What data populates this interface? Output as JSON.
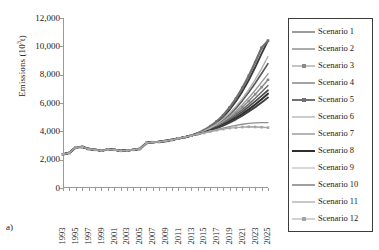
{
  "panel": {
    "letter": "a)"
  },
  "axes": {
    "ylabel_text": "Emissions (10",
    "ylabel_sup": "3",
    "ylabel_tail": "t)",
    "ylabel_full": "Emissions (10³t)",
    "yticks": [
      "12,000",
      "10,000",
      "8,000",
      "6,000",
      "4,000",
      "2,000",
      "0"
    ],
    "xticks": [
      "1993",
      "1995",
      "1997",
      "1999",
      "2001",
      "2003",
      "2005",
      "2007",
      "2009",
      "2011",
      "2013",
      "2015",
      "2017",
      "2019",
      "2021",
      "2023",
      "2025"
    ]
  },
  "legend": {
    "items": [
      {
        "label": "Scenario 1",
        "color": "#3a3a3a",
        "width": 1.9,
        "marker": "none"
      },
      {
        "label": "Scenario 2",
        "color": "#5a5a5a",
        "width": 1.7,
        "marker": "none"
      },
      {
        "label": "Scenario 3",
        "color": "#8a8a8a",
        "width": 1.5,
        "marker": "square"
      },
      {
        "label": "Scenario 4",
        "color": "#4a4a4a",
        "width": 1.7,
        "marker": "none"
      },
      {
        "label": "Scenario 5",
        "color": "#707070",
        "width": 2.2,
        "marker": "square"
      },
      {
        "label": "Scenario 6",
        "color": "#9a9a9a",
        "width": 1.4,
        "marker": "none"
      },
      {
        "label": "Scenario 7",
        "color": "#6a6a6a",
        "width": 1.5,
        "marker": "none"
      },
      {
        "label": "Scenario 8",
        "color": "#2e2e2e",
        "width": 2.0,
        "marker": "none"
      },
      {
        "label": "Scenario 9",
        "color": "#b0b0b0",
        "width": 1.4,
        "marker": "none"
      },
      {
        "label": "Scenario 10",
        "color": "#3f3f3f",
        "width": 1.9,
        "marker": "none"
      },
      {
        "label": "Scenario 11",
        "color": "#8f8f8f",
        "width": 1.3,
        "marker": "none"
      },
      {
        "label": "Scenario 12",
        "color": "#a5a5a5",
        "width": 1.4,
        "marker": "square"
      }
    ]
  },
  "chart_data": {
    "type": "line",
    "title": "",
    "xlabel": "",
    "ylabel": "Emissions (10³t)",
    "xlim": [
      1993,
      2025
    ],
    "ylim": [
      0,
      12000
    ],
    "ytick_step": 2000,
    "grid": false,
    "legend_position": "right",
    "x": [
      1993,
      1994,
      1995,
      1996,
      1997,
      1998,
      1999,
      2000,
      2001,
      2002,
      2003,
      2004,
      2005,
      2006,
      2007,
      2008,
      2009,
      2010,
      2011,
      2012,
      2013,
      2014,
      2015,
      2016,
      2017,
      2018,
      2019,
      2020,
      2021,
      2022,
      2023,
      2024,
      2025
    ],
    "historical_end_year": 2013,
    "historical": [
      2380,
      2480,
      2870,
      2900,
      2760,
      2700,
      2640,
      2720,
      2700,
      2630,
      2650,
      2700,
      2760,
      3180,
      3230,
      3260,
      3320,
      3400,
      3500,
      3580,
      3700,
      3790,
      3880,
      3990,
      4080,
      4160,
      4230,
      4260,
      4300,
      4320,
      4310,
      4290,
      4260
    ],
    "series": [
      {
        "name": "Scenario 1",
        "values": [
          2380,
          2480,
          2870,
          2900,
          2760,
          2700,
          2640,
          2720,
          2700,
          2630,
          2650,
          2700,
          2760,
          3180,
          3230,
          3260,
          3320,
          3400,
          3500,
          3580,
          3700,
          3850,
          4050,
          4300,
          4620,
          5020,
          5520,
          6120,
          6820,
          7620,
          8520,
          9480,
          10400
        ]
      },
      {
        "name": "Scenario 2",
        "values": [
          2380,
          2480,
          2870,
          2900,
          2760,
          2700,
          2640,
          2720,
          2700,
          2630,
          2650,
          2700,
          2760,
          3180,
          3230,
          3260,
          3320,
          3400,
          3500,
          3580,
          3700,
          3830,
          4000,
          4210,
          4470,
          4790,
          5180,
          5640,
          6170,
          6760,
          7400,
          8080,
          8780
        ]
      },
      {
        "name": "Scenario 3",
        "values": [
          2380,
          2480,
          2870,
          2900,
          2760,
          2700,
          2640,
          2720,
          2700,
          2630,
          2650,
          2700,
          2760,
          3180,
          3230,
          3260,
          3320,
          3400,
          3500,
          3580,
          3700,
          3820,
          3970,
          4150,
          4370,
          4630,
          4940,
          5300,
          5700,
          6140,
          6620,
          7120,
          7640
        ]
      },
      {
        "name": "Scenario 4",
        "values": [
          2380,
          2480,
          2870,
          2900,
          2760,
          2700,
          2640,
          2720,
          2700,
          2630,
          2650,
          2700,
          2760,
          3180,
          3230,
          3260,
          3320,
          3400,
          3500,
          3580,
          3700,
          3810,
          3950,
          4110,
          4300,
          4520,
          4780,
          5070,
          5390,
          5740,
          6110,
          6500,
          6900
        ]
      },
      {
        "name": "Scenario 5",
        "values": [
          2380,
          2480,
          2870,
          2900,
          2760,
          2700,
          2640,
          2720,
          2700,
          2630,
          2650,
          2700,
          2760,
          3180,
          3230,
          3260,
          3320,
          3400,
          3500,
          3580,
          3700,
          3860,
          4080,
          4360,
          4710,
          5140,
          5680,
          6320,
          7070,
          7920,
          8880,
          9900,
          10400
        ]
      },
      {
        "name": "Scenario 6",
        "values": [
          2380,
          2480,
          2870,
          2900,
          2760,
          2700,
          2640,
          2720,
          2700,
          2630,
          2650,
          2700,
          2760,
          3180,
          3230,
          3260,
          3320,
          3400,
          3500,
          3580,
          3700,
          3825,
          3985,
          4180,
          4420,
          4710,
          5050,
          5440,
          5880,
          6370,
          6900,
          7470,
          8060
        ]
      },
      {
        "name": "Scenario 7",
        "values": [
          2380,
          2480,
          2870,
          2900,
          2760,
          2700,
          2640,
          2720,
          2700,
          2630,
          2650,
          2700,
          2760,
          3180,
          3230,
          3260,
          3320,
          3400,
          3500,
          3580,
          3700,
          3815,
          3960,
          4130,
          4340,
          4580,
          4860,
          5180,
          5530,
          5920,
          6340,
          6780,
          7240
        ]
      },
      {
        "name": "Scenario 8",
        "values": [
          2380,
          2480,
          2870,
          2900,
          2760,
          2700,
          2640,
          2720,
          2700,
          2630,
          2650,
          2700,
          2760,
          3180,
          3230,
          3260,
          3320,
          3400,
          3500,
          3580,
          3700,
          3805,
          3930,
          4080,
          4250,
          4450,
          4680,
          4940,
          5230,
          5550,
          5900,
          6270,
          6660
        ]
      },
      {
        "name": "Scenario 9",
        "values": [
          2380,
          2480,
          2870,
          2900,
          2760,
          2700,
          2640,
          2720,
          2700,
          2630,
          2650,
          2700,
          2760,
          3180,
          3230,
          3260,
          3320,
          3400,
          3500,
          3580,
          3700,
          3840,
          4020,
          4250,
          4530,
          4870,
          5280,
          5760,
          6310,
          6940,
          7650,
          8430,
          9280
        ]
      },
      {
        "name": "Scenario 10",
        "values": [
          2380,
          2480,
          2870,
          2900,
          2760,
          2700,
          2640,
          2720,
          2700,
          2630,
          2650,
          2700,
          2760,
          3180,
          3230,
          3260,
          3320,
          3400,
          3500,
          3580,
          3700,
          3800,
          3920,
          4060,
          4220,
          4400,
          4610,
          4850,
          5110,
          5400,
          5710,
          6040,
          6390
        ]
      },
      {
        "name": "Scenario 11",
        "values": [
          2380,
          2480,
          2870,
          2900,
          2760,
          2700,
          2640,
          2720,
          2700,
          2630,
          2650,
          2700,
          2760,
          3180,
          3230,
          3260,
          3320,
          3400,
          3500,
          3580,
          3700,
          3795,
          3900,
          4010,
          4120,
          4230,
          4330,
          4420,
          4500,
          4560,
          4600,
          4620,
          4620
        ]
      },
      {
        "name": "Scenario 12",
        "values": [
          2380,
          2480,
          2870,
          2900,
          2760,
          2700,
          2640,
          2720,
          2700,
          2630,
          2650,
          2700,
          2760,
          3180,
          3230,
          3260,
          3320,
          3400,
          3500,
          3580,
          3700,
          3790,
          3880,
          3990,
          4080,
          4160,
          4230,
          4260,
          4300,
          4320,
          4310,
          4290,
          4260
        ]
      }
    ],
    "notes": {
      "fan_start_year": 2013,
      "max_value_2025": 10400,
      "min_value_2025": 3600
    }
  }
}
